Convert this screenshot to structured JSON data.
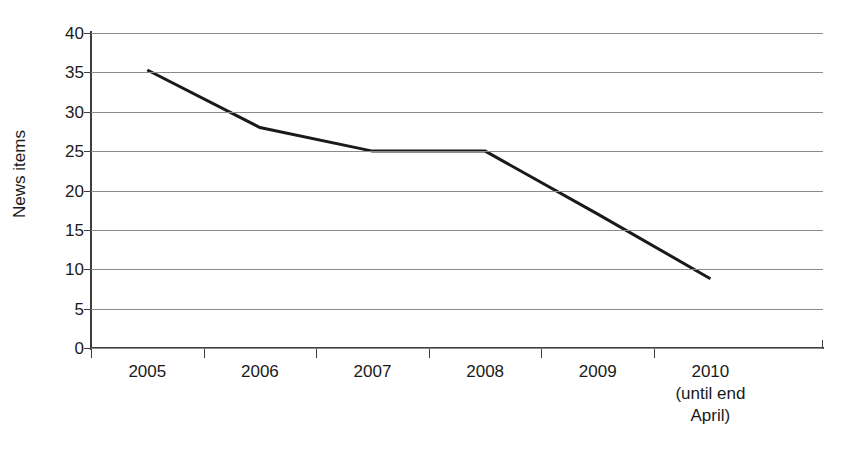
{
  "chart_data": {
    "type": "line",
    "title": "",
    "subtitle": "",
    "xlabel": "",
    "ylabel": "News items",
    "categories": [
      "2005",
      "2006",
      "2007",
      "2008",
      "2009",
      "2010"
    ],
    "category_sublabels": [
      "",
      "",
      "",
      "",
      "",
      "(until end\nApril)"
    ],
    "series": [
      {
        "name": "News items",
        "values": [
          35.3,
          28.0,
          25.0,
          25.0,
          17.0,
          8.8
        ],
        "color": "#1a1a1a",
        "line_width": 3
      }
    ],
    "ylim": [
      0,
      40
    ],
    "yticks": [
      0,
      5,
      10,
      15,
      20,
      25,
      30,
      35,
      40
    ],
    "ytick_labels": [
      "0",
      "5",
      "10",
      "15",
      "20",
      "25",
      "30",
      "35",
      "40"
    ],
    "grid": {
      "horizontal": true,
      "vertical": false,
      "color": "#8a8a8a"
    },
    "legend": {
      "visible": false,
      "position": "none"
    },
    "axis_color": "#3d3d3d",
    "background": "#ffffff"
  },
  "xaxis": {
    "labels": [
      {
        "year": "2005",
        "sub1": "",
        "sub2": ""
      },
      {
        "year": "2006",
        "sub1": "",
        "sub2": ""
      },
      {
        "year": "2007",
        "sub1": "",
        "sub2": ""
      },
      {
        "year": "2008",
        "sub1": "",
        "sub2": ""
      },
      {
        "year": "2009",
        "sub1": "",
        "sub2": ""
      },
      {
        "year": "2010",
        "sub1": "(until end",
        "sub2": "April)"
      }
    ]
  }
}
